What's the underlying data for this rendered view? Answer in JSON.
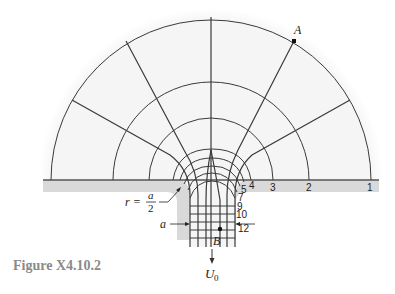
{
  "figure": {
    "caption": "Figure X4.10.2",
    "colors": {
      "flow_fill": "#f3f3f3",
      "wall_fill": "#d8d8d8",
      "line": "#3a3a3a",
      "caption": "#8a8a8a"
    },
    "labels": {
      "point_a": "A",
      "point_b": "B",
      "radius_r": "r =",
      "radius_num": "a",
      "radius_den": "2",
      "width_a": "a",
      "velocity": "U",
      "velocity_sub": "0"
    },
    "streamline_numbers": [
      {
        "text": "1",
        "x": 367,
        "y": 191
      },
      {
        "text": "2",
        "x": 306,
        "y": 191
      },
      {
        "text": "3",
        "x": 270,
        "y": 191
      },
      {
        "text": "4",
        "x": 249,
        "y": 189
      },
      {
        "text": "5",
        "x": 241,
        "y": 193
      },
      {
        "text": "7",
        "x": 238,
        "y": 201
      },
      {
        "text": "9",
        "x": 237,
        "y": 210
      },
      {
        "text": "10",
        "x": 236,
        "y": 218
      },
      {
        "text": "12",
        "x": 238,
        "y": 232
      }
    ]
  }
}
